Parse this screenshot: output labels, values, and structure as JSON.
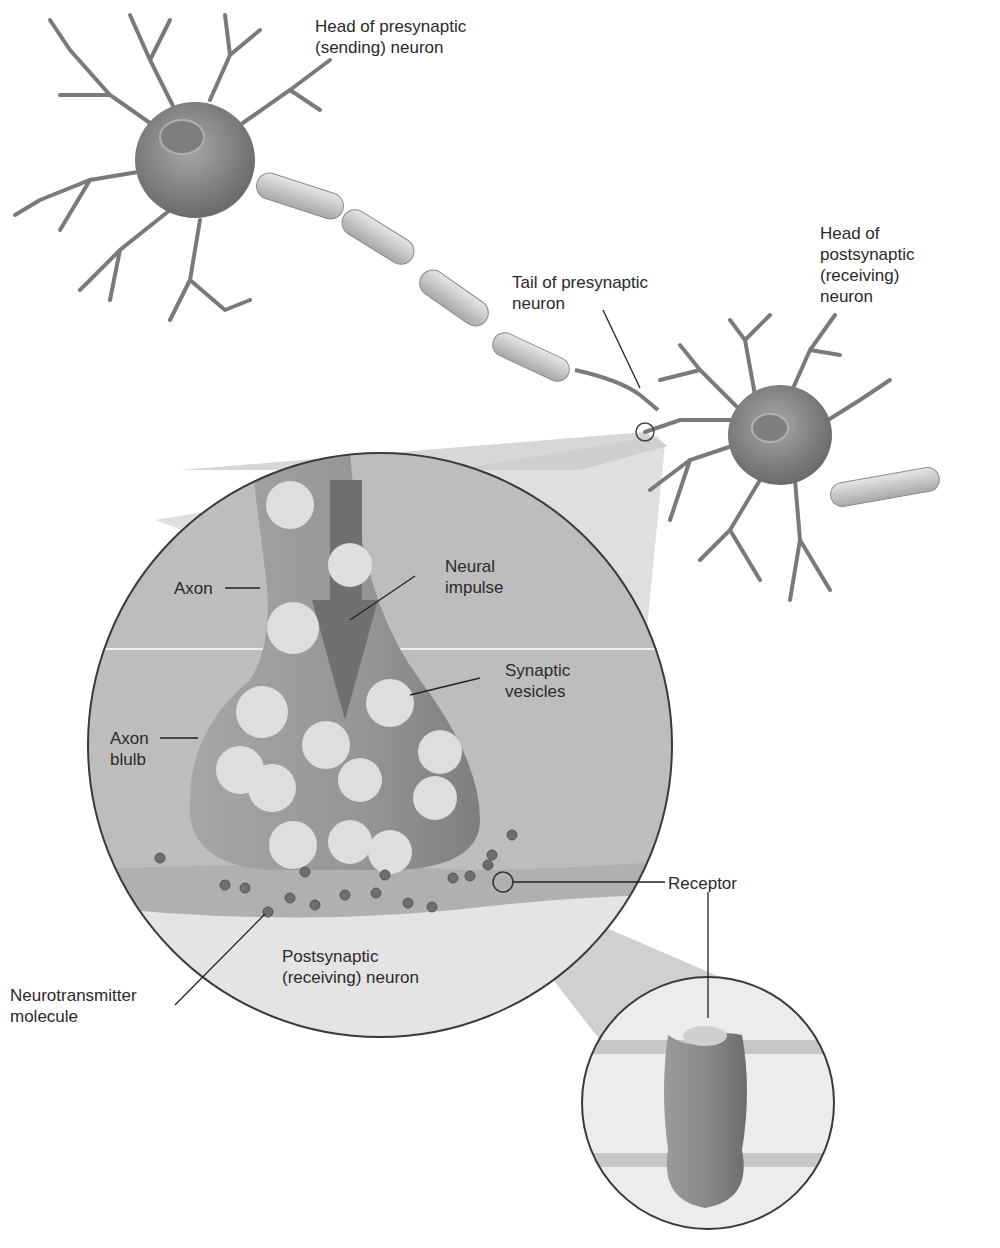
{
  "diagram": {
    "labels": {
      "head_presynaptic": "Head of presynaptic\n(sending) neuron",
      "tail_presynaptic": "Tail of presynaptic\nneuron",
      "head_postsynaptic": "Head of\npostsynaptic\n(receiving)\nneuron",
      "axon": "Axon",
      "neural_impulse": "Neural\nimpulse",
      "synaptic_vesicles": "Synaptic\nvesicles",
      "axon_bulb": "Axon\nblulb",
      "receptor": "Receptor",
      "postsynaptic_neuron": "Postsynaptic\n(receiving) neuron",
      "neurotransmitter": "Neurotransmitter\nmolecule"
    },
    "colors": {
      "neuron_body": "#8a8a8a",
      "myelin": "#c8c8c8",
      "circle_bg": "#bdbdbd",
      "axon_fill": "#9a9a9a",
      "vesicle": "#dedede",
      "molecule": "#6e6e6e",
      "postsynaptic_bg": "#e4e4e4"
    }
  }
}
